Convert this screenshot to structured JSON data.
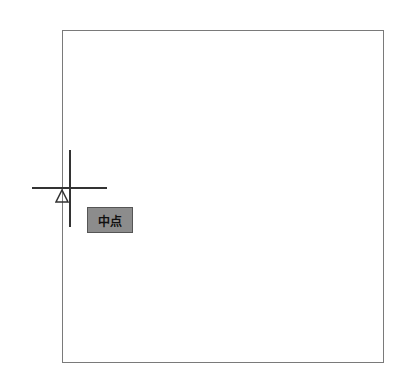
{
  "drawing": {
    "shape": "rectangle",
    "border_color": "#7a7a7a"
  },
  "cursor": {
    "type": "crosshair",
    "color": "#333333"
  },
  "snap": {
    "marker_icon": "midpoint-triangle-icon",
    "tooltip_label": "中点",
    "tooltip_bg": "#8c8c8c"
  }
}
